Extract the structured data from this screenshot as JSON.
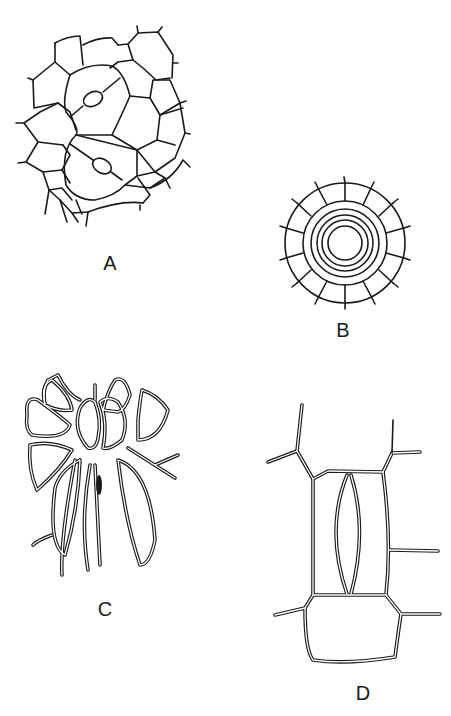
{
  "figure": {
    "panels": [
      {
        "id": "A",
        "label": "A",
        "description": "Epidermal cell network with two stomata (paired guard cells with oval pores)"
      },
      {
        "id": "B",
        "label": "B",
        "description": "Sunken stoma surrounded by concentric rings of subsidiary cells"
      },
      {
        "id": "C",
        "label": "C",
        "description": "Stoma with radiating ring of thick-walled subsidiary cells"
      },
      {
        "id": "D",
        "label": "D",
        "description": "Elongated stoma (lens-shaped guard cells) between rectangular subsidiary cells, double-line walls"
      }
    ]
  },
  "colors": {
    "line": "#1a1a1a",
    "background": "#ffffff"
  }
}
